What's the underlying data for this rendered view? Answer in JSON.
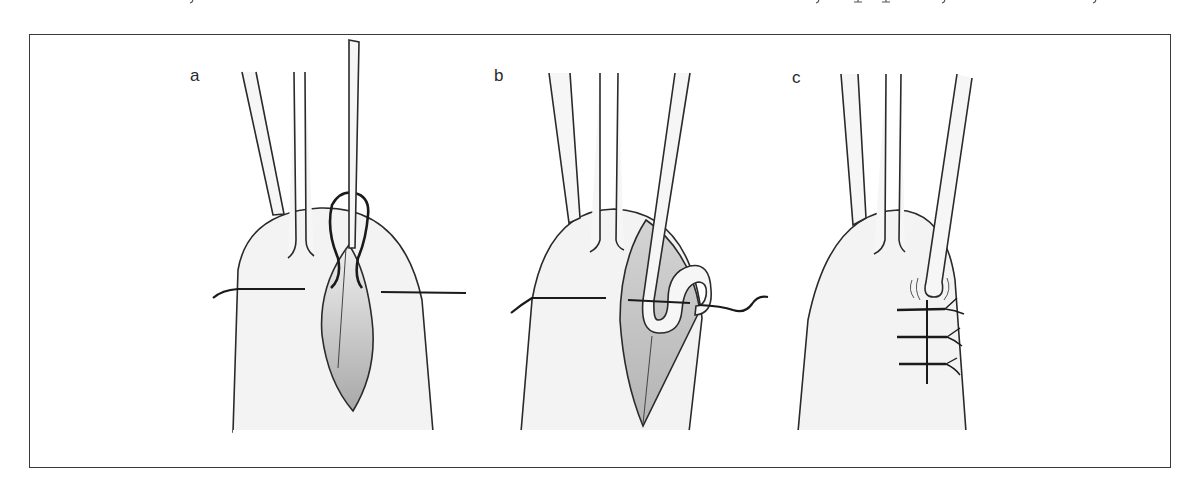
{
  "figure": {
    "panels": [
      {
        "id": "a",
        "label": "a",
        "description": "Retractors holding skin edges; needle passed through wound with suture loop above, thread crossing horizontally"
      },
      {
        "id": "b",
        "label": "b",
        "description": "Hook instrument pulling suture loop through wound; thread crossing horizontally with wavy free end"
      },
      {
        "id": "c",
        "label": "c",
        "description": "Closed wound with three interrupted sutures; instrument tip at top of incision with motion marks"
      }
    ]
  },
  "colors": {
    "line": "#2a2a2a",
    "finger_fill": "#f3f3f3",
    "instrument_fill": "#f6f6f6",
    "wound_gradient_top": "#ececec",
    "wound_gradient_bottom": "#a9a9a9",
    "frame": "#3a3a3a",
    "background": "#ffffff"
  }
}
